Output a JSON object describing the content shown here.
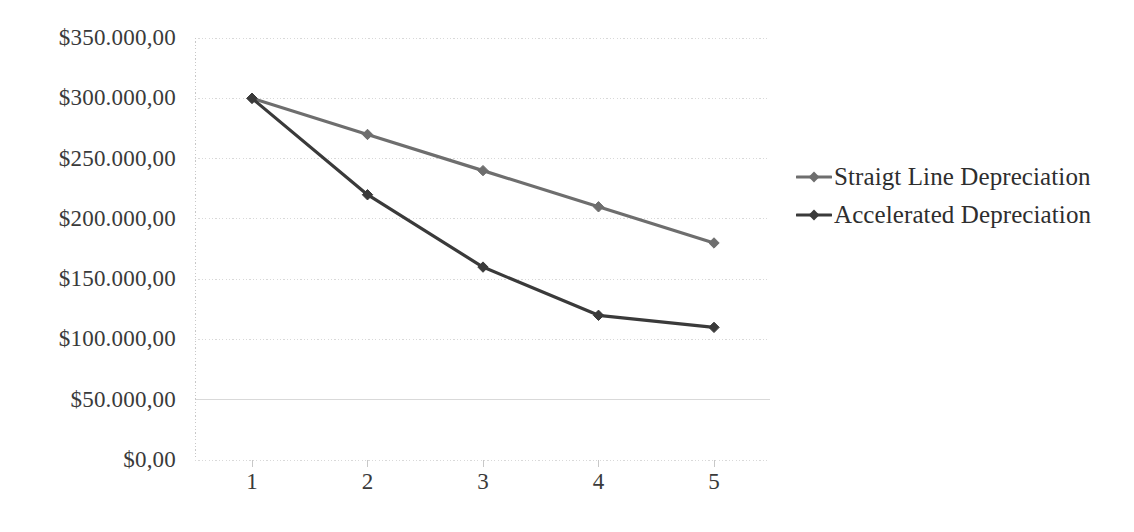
{
  "chart_data": {
    "type": "line",
    "title": "",
    "subtitle": "",
    "xlabel": "",
    "ylabel": "",
    "categories": [
      "1",
      "2",
      "3",
      "4",
      "5"
    ],
    "ylim": [
      0,
      350000
    ],
    "ytick_values": [
      0,
      50000,
      100000,
      150000,
      200000,
      250000,
      300000,
      350000
    ],
    "ytick_labels": [
      "$0,00",
      "$50.000,00",
      "$100.000,00",
      "$150.000,00",
      "$200.000,00",
      "$250.000,00",
      "$300.000,00",
      "$350.000,00"
    ],
    "grid": true,
    "grid_axis": "y",
    "legend_position": "right",
    "marker": "diamond",
    "series": [
      {
        "name": "Straigt Line Depreciation",
        "color": "#6e6e6e",
        "values": [
          300000,
          270000,
          240000,
          210000,
          180000
        ]
      },
      {
        "name": "Accelerated Depreciation",
        "color": "#3a3a3a",
        "values": [
          300000,
          220000,
          160000,
          120000,
          110000
        ]
      }
    ]
  },
  "legend": {
    "items": [
      {
        "label": "Straigt Line Depreciation",
        "color": "#6e6e6e"
      },
      {
        "label": "Accelerated Depreciation",
        "color": "#3a3a3a"
      }
    ]
  },
  "axes": {
    "y_labels": [
      "$350.000,00",
      "$300.000,00",
      "$250.000,00",
      "$200.000,00",
      "$150.000,00",
      "$100.000,00",
      "$50.000,00",
      "$0,00"
    ],
    "x_labels": [
      "1",
      "2",
      "3",
      "4",
      "5"
    ]
  },
  "colors": {
    "grid": "#d9d9d9",
    "axis": "#c8c8c8",
    "text": "#3a3a3a",
    "series_light": "#6e6e6e",
    "series_dark": "#3a3a3a",
    "background": "#ffffff"
  }
}
